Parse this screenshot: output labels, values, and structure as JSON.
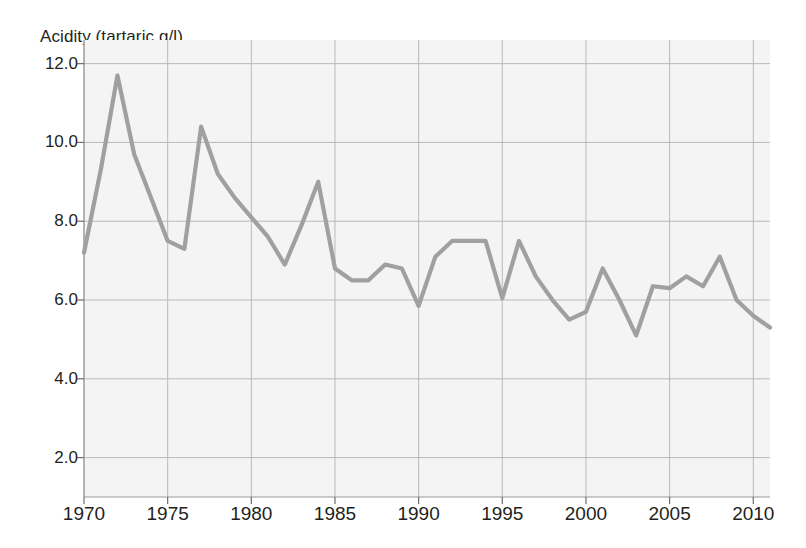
{
  "chart_data": {
    "type": "line",
    "title": "Acidity (tartaric g/l)",
    "xlabel": "",
    "ylabel": "Acidity (tartaric g/l)",
    "xlim": [
      1970,
      2011
    ],
    "ylim": [
      1.0,
      12.6
    ],
    "grid": true,
    "legend": false,
    "line_color": "#a0a0a0",
    "plot_background": "#f4f4f4",
    "grid_color": "#b9b9b9",
    "text_color": "#231f20",
    "xticks": [
      1970,
      1975,
      1980,
      1985,
      1990,
      1995,
      2000,
      2005,
      2010
    ],
    "xtick_labels": [
      "1970",
      "1975",
      "1980",
      "1985",
      "1990",
      "1995",
      "2000",
      "2005",
      "2010"
    ],
    "yticks": [
      2.0,
      4.0,
      6.0,
      8.0,
      10.0,
      12.0
    ],
    "ytick_labels": [
      "2.0",
      "4.0",
      "6.0",
      "8.0",
      "10.0",
      "12.0"
    ],
    "x": [
      1970,
      1971,
      1972,
      1973,
      1974,
      1975,
      1976,
      1977,
      1978,
      1979,
      1980,
      1981,
      1982,
      1983,
      1984,
      1985,
      1986,
      1987,
      1988,
      1989,
      1990,
      1991,
      1992,
      1993,
      1994,
      1995,
      1996,
      1997,
      1998,
      1999,
      2000,
      2001,
      2002,
      2003,
      2004,
      2005,
      2006,
      2007,
      2008,
      2009,
      2010,
      2011
    ],
    "values": [
      7.2,
      9.3,
      11.7,
      9.7,
      8.6,
      7.5,
      7.3,
      10.4,
      9.2,
      8.6,
      8.1,
      7.6,
      6.9,
      7.9,
      9.0,
      6.8,
      6.5,
      6.5,
      6.9,
      6.8,
      5.85,
      7.1,
      7.5,
      7.5,
      7.5,
      6.05,
      7.5,
      6.6,
      6.0,
      5.5,
      5.7,
      6.8,
      6.0,
      5.1,
      6.35,
      6.3,
      6.6,
      6.35,
      7.1,
      6.0,
      5.6,
      5.3
    ],
    "series_name": "Acidity"
  }
}
